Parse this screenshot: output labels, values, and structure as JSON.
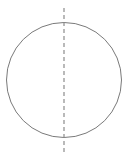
{
  "canvas": {
    "width": 129,
    "height": 158,
    "background_color": "#ffffff",
    "title": "Circle with vertical axis of symmetry"
  },
  "figure": {
    "type": "geometry-diagram",
    "shape": {
      "name": "circle",
      "center_x": 64,
      "center_y": 80,
      "radius": 57.5,
      "stroke_color": "#7a7a7a",
      "stroke_width": 1,
      "fill": "none"
    },
    "axis": {
      "name": "vertical-axis-of-symmetry",
      "orientation": "vertical",
      "x": 64,
      "y_start": 8,
      "y_end": 152,
      "stroke_color": "#8c8c8c",
      "stroke_width": 1.2,
      "dash_on": 4,
      "dash_off": 3
    }
  }
}
